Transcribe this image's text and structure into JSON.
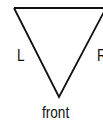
{
  "diagram": {
    "shape": "inverted-triangle",
    "labels": {
      "left": "L",
      "right": "R",
      "bottom": "front"
    },
    "stroke_color": "#111111"
  }
}
